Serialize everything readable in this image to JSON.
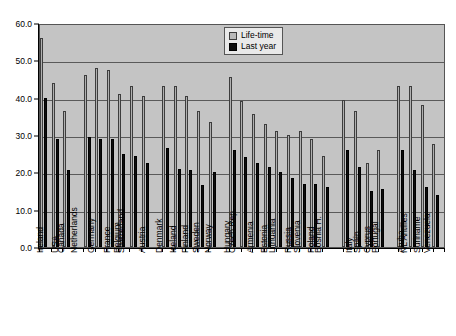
{
  "chart_data": {
    "type": "bar",
    "title": "",
    "xlabel": "",
    "ylabel": "",
    "ylim": [
      0,
      60
    ],
    "ytick_values": [
      0,
      10,
      20,
      30,
      40,
      50,
      60
    ],
    "ytick_labels": [
      "0.0",
      "10.0",
      "20.0",
      "30.0",
      "40.0",
      "50.0",
      "60.0"
    ],
    "grid": true,
    "legend_position": "top-center-right",
    "categories": [
      "Ireland",
      "USA",
      "Canada",
      "Netherlands",
      "Germany",
      "France",
      "Belgium",
      "Switzerland",
      "Austria",
      "Denmark",
      "Iceland",
      "Finland",
      "Sweden",
      "Norway",
      "Hungary",
      "Czech Rep.",
      "Armenia",
      "Estonia",
      "Lithuania",
      "Russia",
      "Slovenia",
      "Poland",
      "Bosnia H.",
      "Italy",
      "Spain",
      "Cyprus",
      "Portugal",
      "Aruba",
      "NL Antilles",
      "Suriname",
      "Venezuela"
    ],
    "groups": [
      {
        "name": "North America / Ireland",
        "count": 3
      },
      {
        "name": "Western Europe",
        "count": 6
      },
      {
        "name": "Nordic",
        "count": 5
      },
      {
        "name": "Central and Eastern Europe",
        "count": 9
      },
      {
        "name": "Southern Europe",
        "count": 4
      },
      {
        "name": "Caribbean / South America",
        "count": 4
      }
    ],
    "series": [
      {
        "name": "Life-time",
        "color": "#b0b0b0",
        "values": [
          56.0,
          44.0,
          36.5,
          46.0,
          48.0,
          47.5,
          41.0,
          43.0,
          40.5,
          43.0,
          43.0,
          40.5,
          36.5,
          33.5,
          45.5,
          39.0,
          35.5,
          33.0,
          31.0,
          30.0,
          31.0,
          29.0,
          24.5,
          39.5,
          36.5,
          22.5,
          26.0,
          43.0,
          43.0,
          38.0,
          27.5
        ]
      },
      {
        "name": "Last year",
        "color": "#0d0d0d",
        "values": [
          40.0,
          29.0,
          20.5,
          29.5,
          29.0,
          29.0,
          25.0,
          24.5,
          22.5,
          26.5,
          21.0,
          20.5,
          16.5,
          20.0,
          26.0,
          24.0,
          22.5,
          21.5,
          20.0,
          18.5,
          17.0,
          17.0,
          16.0,
          26.0,
          21.5,
          15.0,
          15.5,
          26.0,
          20.5,
          16.0,
          14.0
        ]
      }
    ]
  },
  "legend": {
    "entries": [
      {
        "label": "Life-time",
        "swatch": "lifetime"
      },
      {
        "label": "Last year",
        "swatch": "lastyear"
      }
    ]
  }
}
